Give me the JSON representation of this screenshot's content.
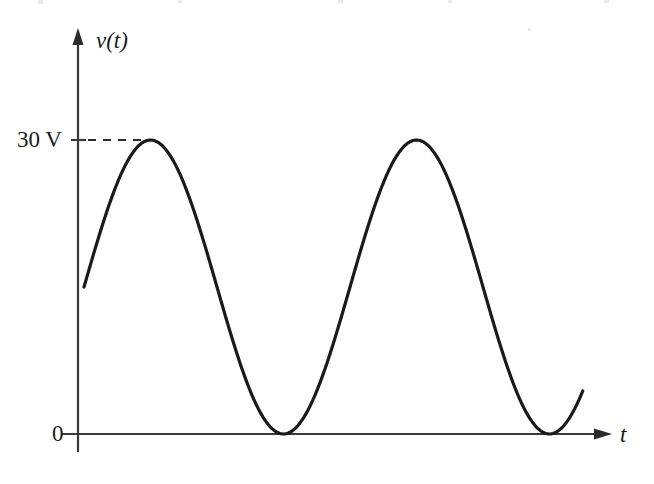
{
  "figure": {
    "name": "sinusoidal-voltage-waveform",
    "background_color": "#ffffff",
    "ink_color": "#1a1a1a"
  },
  "labels": {
    "y_axis_name": "v(t)",
    "x_axis_name": "t",
    "y_tick_30v": "30 V",
    "y_tick_zero": "0"
  },
  "chart_data": {
    "type": "line",
    "title": "",
    "xlabel": "t",
    "ylabel": "v(t)",
    "subtitle": "",
    "grid": false,
    "legend": null,
    "annotations": [
      {
        "name": "peak-dashed-guide",
        "text": "30 V",
        "kind": "dashed-horizontal-leader",
        "y_value": 30,
        "from_x": 0,
        "to_x": 0.25
      }
    ],
    "axis": {
      "x_range": [
        0,
        2.11
      ],
      "y_range": [
        0,
        33
      ],
      "x_tick_labels": [],
      "y_tick_labels": [
        "0",
        "30 V"
      ],
      "y_tick_values": [
        0,
        30
      ],
      "x_arrow": true,
      "y_arrow": true
    },
    "waveform": {
      "description": "raised sinusoid, fully positive, touching 0 V at minima and 30 V at maxima",
      "amplitude": 15,
      "offset": 15,
      "peak_value": 30,
      "min_value": 0,
      "units": "V",
      "period_x": 1.0,
      "start_x": 0,
      "end_x": 1.875,
      "start_value": 15.2,
      "end_value": 5.7,
      "extrema": [
        {
          "kind": "maximum",
          "x": 0.25,
          "y": 30
        },
        {
          "kind": "minimum",
          "x": 0.75,
          "y": 0
        },
        {
          "kind": "maximum",
          "x": 1.25,
          "y": 30
        },
        {
          "kind": "minimum",
          "x": 1.75,
          "y": 0
        }
      ],
      "x": [
        0.0,
        0.05,
        0.1,
        0.15,
        0.2,
        0.25,
        0.3,
        0.35,
        0.4,
        0.45,
        0.5,
        0.55,
        0.6,
        0.65,
        0.7,
        0.75,
        0.8,
        0.85,
        0.9,
        0.95,
        1.0,
        1.05,
        1.1,
        1.15,
        1.2,
        1.25,
        1.3,
        1.35,
        1.4,
        1.45,
        1.5,
        1.55,
        1.6,
        1.65,
        1.7,
        1.75,
        1.8,
        1.85,
        1.875
      ],
      "y": [
        15.0,
        19.6,
        23.8,
        27.1,
        29.3,
        30.0,
        29.3,
        27.1,
        23.8,
        19.6,
        15.0,
        10.4,
        6.2,
        2.9,
        0.7,
        0.0,
        0.7,
        2.9,
        6.2,
        10.4,
        15.0,
        19.6,
        23.8,
        27.1,
        29.3,
        30.0,
        29.3,
        27.1,
        23.8,
        19.6,
        15.0,
        10.4,
        6.2,
        2.9,
        0.7,
        0.0,
        0.7,
        2.9,
        5.7
      ]
    }
  }
}
